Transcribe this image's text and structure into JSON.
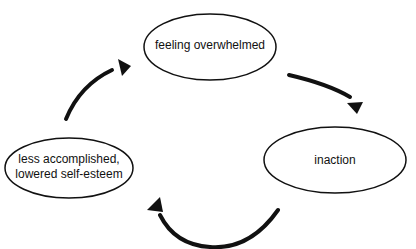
{
  "diagram": {
    "type": "cycle",
    "nodes": [
      {
        "id": "n1",
        "label": "feeling overwhelmed"
      },
      {
        "id": "n2",
        "label": "inaction"
      },
      {
        "id": "n3",
        "label": "less accomplished,\nlowered self-esteem"
      }
    ],
    "edges": [
      {
        "from": "n1",
        "to": "n2"
      },
      {
        "from": "n2",
        "to": "n3"
      },
      {
        "from": "n3",
        "to": "n1"
      }
    ],
    "colors": {
      "stroke": "#111111",
      "background": "#ffffff"
    }
  }
}
